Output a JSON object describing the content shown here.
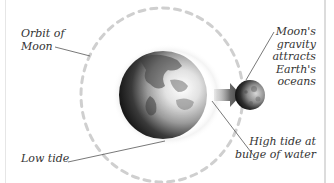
{
  "diagram": {
    "labels": {
      "orbit": {
        "lines": [
          "Orbit of",
          "Moon"
        ]
      },
      "gravity": {
        "lines": [
          "Moon's",
          "gravity",
          "attracts",
          "Earth's",
          "oceans"
        ]
      },
      "high_tide": {
        "lines": [
          "High tide at",
          "bulge of water"
        ]
      },
      "low_tide": {
        "lines": [
          "Low tide"
        ]
      }
    },
    "elements": {
      "earth": {
        "name": "Earth",
        "cx": 163,
        "cy": 95,
        "r": 44
      },
      "moon": {
        "name": "Moon",
        "cx": 250,
        "cy": 95,
        "r": 15
      },
      "orbit": {
        "cx": 162,
        "cy": 95,
        "rx": 81,
        "ry": 87,
        "style": "dashed"
      },
      "arrow": {
        "direction": "right",
        "color": "#555555"
      }
    },
    "colors": {
      "orbit": "#cfcfcf",
      "leader_line": "#555555",
      "text": "#333333",
      "frame": "#dcdcdc"
    }
  }
}
